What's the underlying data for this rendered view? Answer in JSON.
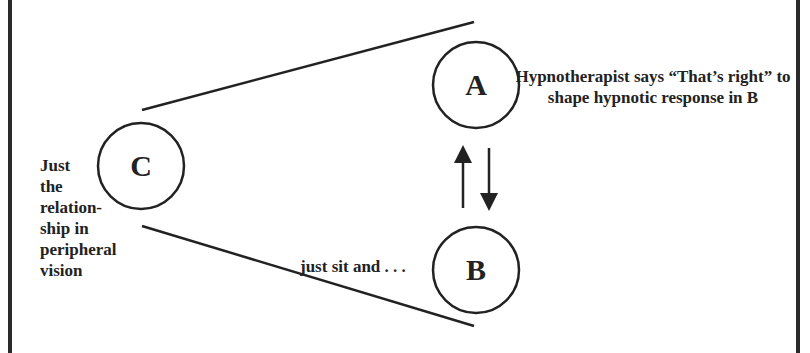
{
  "diagram": {
    "nodes": [
      {
        "id": "A",
        "letter": "A"
      },
      {
        "id": "B",
        "letter": "B"
      },
      {
        "id": "C",
        "letter": "C"
      }
    ],
    "annotations": {
      "a": "Hypnotherapist says “That’s right” to shape hypnotic response in B",
      "b": "just sit and . . .",
      "c_lines": [
        "Just",
        "the",
        "relation-",
        "ship in",
        "peripheral",
        "vision"
      ]
    },
    "arrows": [
      {
        "from": "B",
        "to": "A",
        "direction": "up"
      },
      {
        "from": "A",
        "to": "B",
        "direction": "down"
      }
    ],
    "colors": {
      "stroke": "#222222",
      "background": "#ffffff"
    }
  }
}
